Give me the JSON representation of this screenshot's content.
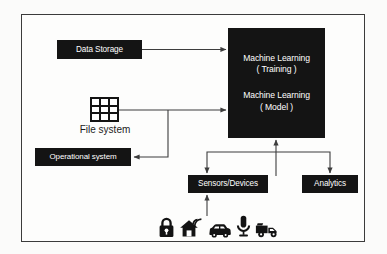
{
  "diagram": {
    "frame": {
      "border_color": "#3b3b3b",
      "background": "#fdfdfc"
    },
    "palette": {
      "box_fill": "#141414",
      "box_text": "#ffffff",
      "line": "#3d3d3d",
      "icon": "#131313",
      "page_background": "#fbfbfa"
    },
    "nodes": {
      "data_storage": {
        "label": "Data Storage",
        "shape": "filled-rect"
      },
      "machine_learning": {
        "shape": "filled-rect",
        "line1": "Machine Learning",
        "line2": "( Training )",
        "line3": "Machine Learning",
        "line4": "( Model )"
      },
      "file_system": {
        "label": "File system",
        "icon": "grid-3x3-icon"
      },
      "operational_system": {
        "label": "Operational system",
        "shape": "filled-rect"
      },
      "sensors_devices": {
        "label": "Sensors/Devices",
        "shape": "filled-rect"
      },
      "analytics": {
        "label": "Analytics",
        "shape": "filled-rect"
      }
    },
    "edges": [
      {
        "from": "data_storage",
        "to": "machine_learning",
        "arrow": "to"
      },
      {
        "from": "file_system",
        "to": "machine_learning",
        "arrow": "to"
      },
      {
        "from": "file_system",
        "to": "operational_system",
        "arrow": "to"
      },
      {
        "from": "sensors_devices",
        "to": "machine_learning",
        "arrow": "to"
      },
      {
        "from": "machine_learning",
        "to": "sensors_devices",
        "arrow": "to"
      },
      {
        "from": "machine_learning",
        "to": "analytics",
        "arrow": "to"
      },
      {
        "from": "device_icons",
        "to": "sensors_devices",
        "arrow": "to"
      }
    ],
    "device_icons": [
      {
        "name": "padlock-icon",
        "label": "Padlock"
      },
      {
        "name": "smart-home-icon",
        "label": "Smart home"
      },
      {
        "name": "car-icon",
        "label": "Car"
      },
      {
        "name": "microphone-icon",
        "label": "Microphone"
      },
      {
        "name": "truck-icon",
        "label": "Truck"
      }
    ]
  }
}
